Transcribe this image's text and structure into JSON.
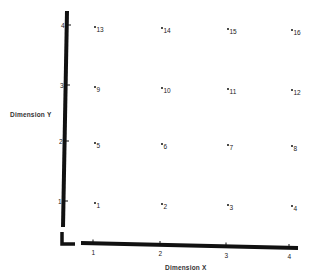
{
  "chart_data": {
    "type": "scatter",
    "title": "",
    "xlabel": "Dimension X",
    "ylabel": "Dimension Y",
    "xlim": [
      0.6,
      4.1
    ],
    "ylim": [
      0.5,
      4.2
    ],
    "grid": false,
    "legend": null,
    "x_ticks": [
      "1",
      "2",
      "3",
      "4"
    ],
    "y_ticks": [
      "1",
      "2",
      "3",
      "4"
    ],
    "points": [
      {
        "label": "1",
        "x": 1,
        "y": 1
      },
      {
        "label": "2",
        "x": 2,
        "y": 1
      },
      {
        "label": "3",
        "x": 3,
        "y": 1
      },
      {
        "label": "4",
        "x": 4,
        "y": 1
      },
      {
        "label": "5",
        "x": 1,
        "y": 2
      },
      {
        "label": "6",
        "x": 2,
        "y": 2
      },
      {
        "label": "7",
        "x": 3,
        "y": 2
      },
      {
        "label": "8",
        "x": 4,
        "y": 2
      },
      {
        "label": "9",
        "x": 1,
        "y": 3
      },
      {
        "label": "10",
        "x": 2,
        "y": 3
      },
      {
        "label": "11",
        "x": 3,
        "y": 3
      },
      {
        "label": "12",
        "x": 4,
        "y": 3
      },
      {
        "label": "13",
        "x": 1,
        "y": 4
      },
      {
        "label": "14",
        "x": 2,
        "y": 4
      },
      {
        "label": "15",
        "x": 3,
        "y": 4
      },
      {
        "label": "16",
        "x": 4,
        "y": 4
      }
    ]
  },
  "labels": {
    "x_axis": "Dimension X",
    "y_axis": "Dimension Y"
  }
}
